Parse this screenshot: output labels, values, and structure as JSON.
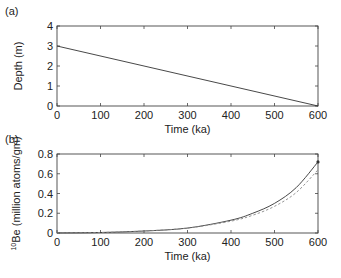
{
  "chart_data": [
    {
      "panel_label": "(a)",
      "type": "line",
      "title": "",
      "xlabel": "Time (ka)",
      "ylabel": "Depth (m)",
      "xlim": [
        0,
        600
      ],
      "ylim": [
        0,
        4
      ],
      "xticks": [
        "0",
        "100",
        "200",
        "300",
        "400",
        "500",
        "600"
      ],
      "yticks": [
        "0",
        "1",
        "2",
        "3",
        "4"
      ],
      "grid": false,
      "series": [
        {
          "name": "depth",
          "style": "solid",
          "x": [
            0,
            600
          ],
          "y": [
            3.0,
            0.0
          ]
        }
      ]
    },
    {
      "panel_label": "(b)",
      "type": "line",
      "title": "",
      "xlabel": "Time (ka)",
      "ylabel_sup": "10",
      "ylabel": "Be (million atoms/gm)",
      "xlim": [
        0,
        600
      ],
      "ylim": [
        0,
        0.8
      ],
      "xticks": [
        "0",
        "100",
        "200",
        "300",
        "400",
        "500",
        "600"
      ],
      "yticks": [
        "0",
        "0.2",
        "0.4",
        "0.6",
        "0.8"
      ],
      "grid": false,
      "series": [
        {
          "name": "solid",
          "style": "solid",
          "x": [
            0,
            100,
            200,
            300,
            400,
            450,
            500,
            550,
            600
          ],
          "y": [
            0.0,
            0.005,
            0.02,
            0.05,
            0.13,
            0.2,
            0.3,
            0.46,
            0.72
          ]
        },
        {
          "name": "dashed",
          "style": "dashed",
          "x": [
            0,
            100,
            200,
            300,
            400,
            450,
            500,
            550,
            600
          ],
          "y": [
            0.0,
            0.005,
            0.02,
            0.05,
            0.12,
            0.18,
            0.27,
            0.41,
            0.64
          ]
        },
        {
          "name": "marker",
          "style": "point",
          "x": [
            600
          ],
          "y": [
            0.72
          ]
        }
      ]
    }
  ]
}
